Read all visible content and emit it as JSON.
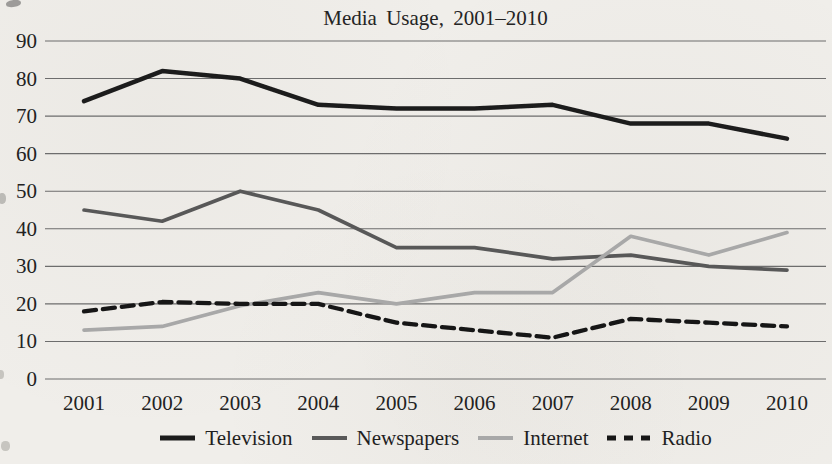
{
  "chart_data": {
    "type": "line",
    "title": "Media Usage, 2001–2010",
    "categories": [
      "2001",
      "2002",
      "2003",
      "2004",
      "2005",
      "2006",
      "2007",
      "2008",
      "2009",
      "2010"
    ],
    "series": [
      {
        "name": "Television",
        "color": "#1c1c1c",
        "stroke_width": 4.5,
        "dashed": false,
        "values": [
          74,
          82,
          80,
          73,
          72,
          72,
          73,
          68,
          68,
          64
        ]
      },
      {
        "name": "Newspapers",
        "color": "#595959",
        "stroke_width": 3.7,
        "dashed": false,
        "values": [
          45,
          42,
          50,
          45,
          35,
          35,
          32,
          33,
          30,
          29
        ]
      },
      {
        "name": "Internet",
        "color": "#a8a8a8",
        "stroke_width": 3.7,
        "dashed": false,
        "values": [
          13,
          14,
          19.5,
          23,
          20,
          23,
          23,
          38,
          33,
          39
        ]
      },
      {
        "name": "Radio",
        "color": "#161616",
        "stroke_width": 4.3,
        "dashed": true,
        "values": [
          18,
          20.5,
          20,
          20,
          15,
          13,
          11,
          16,
          15,
          14
        ]
      }
    ],
    "xlabel": "",
    "ylabel": "",
    "ylim": [
      0,
      90
    ],
    "yticks": [
      0,
      10,
      20,
      30,
      40,
      50,
      60,
      70,
      80,
      90
    ],
    "grid": true,
    "legend_position": "bottom",
    "dash_pattern": "12 7",
    "legend_dash_pattern": "9 8"
  },
  "colors": {
    "background": "#f0eeea",
    "gridline": "#6d6d6d",
    "text": "#222222"
  }
}
